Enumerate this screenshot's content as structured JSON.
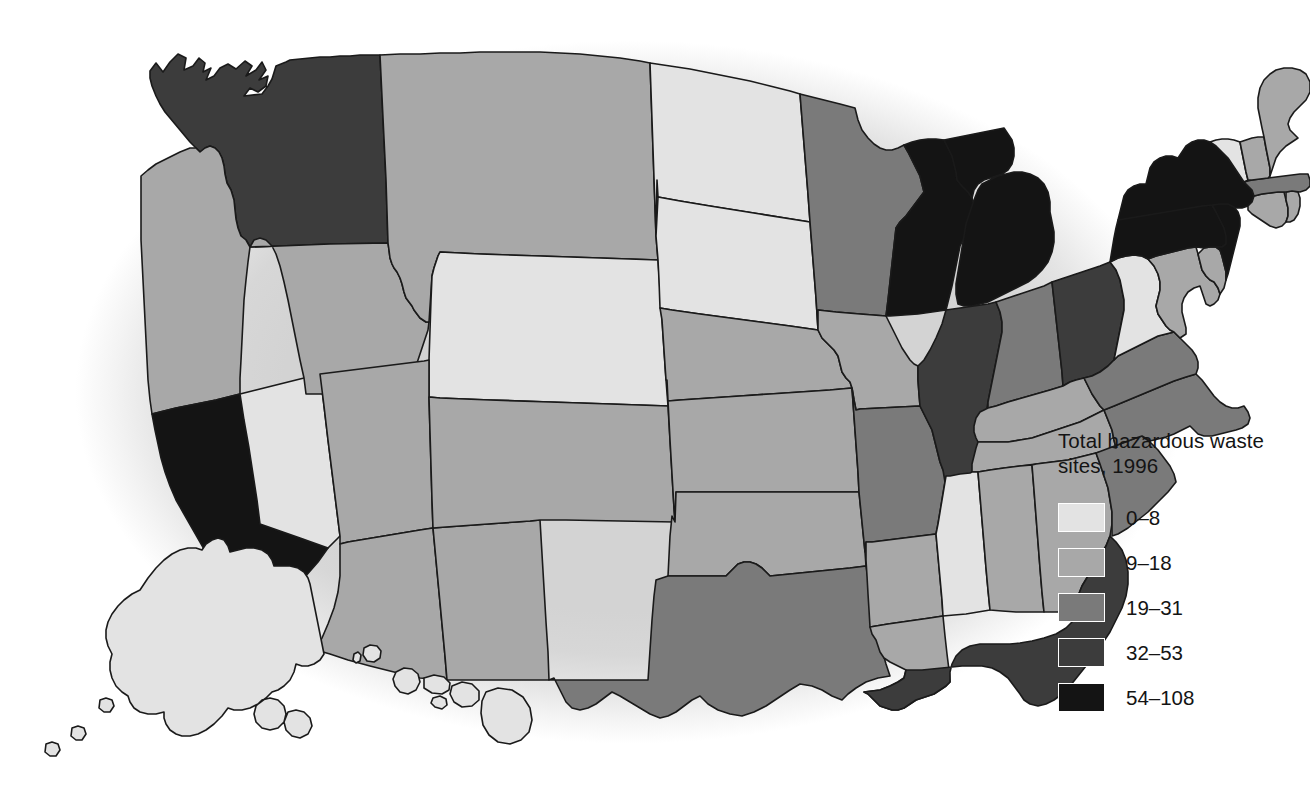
{
  "legend": {
    "title": "Total hazardous waste sites, 1996",
    "title_line1": "Total hazardous waste",
    "title_line2": "sites, 1996",
    "classes": [
      {
        "label": "0–8",
        "color": "#e3e3e3",
        "min": 0,
        "max": 8
      },
      {
        "label": "9–18",
        "color": "#a8a8a8",
        "min": 9,
        "max": 18
      },
      {
        "label": "19–31",
        "color": "#7a7a7a",
        "min": 19,
        "max": 31
      },
      {
        "label": "32–53",
        "color": "#3c3c3c",
        "min": 32,
        "max": 53
      },
      {
        "label": "54–108",
        "color": "#141414",
        "min": 54,
        "max": 108
      }
    ]
  },
  "map": {
    "background_color": "#d3d3d3",
    "border_color": "#1a1a1a",
    "page_color": "#ffffff"
  },
  "chart_data": {
    "type": "map",
    "title": "Total hazardous waste sites, 1996",
    "variable": "Total hazardous waste sites",
    "year": 1996,
    "classification": "choropleth, 5 classes",
    "bins": [
      "0–8",
      "9–18",
      "19–31",
      "32–53",
      "54–108"
    ],
    "bin_colors": [
      "#e3e3e3",
      "#a8a8a8",
      "#7a7a7a",
      "#3c3c3c",
      "#141414"
    ],
    "states": [
      {
        "code": "WA",
        "name": "Washington",
        "bin": 3
      },
      {
        "code": "OR",
        "name": "Oregon",
        "bin": 1
      },
      {
        "code": "CA",
        "name": "California",
        "bin": 4
      },
      {
        "code": "NV",
        "name": "Nevada",
        "bin": 0
      },
      {
        "code": "ID",
        "name": "Idaho",
        "bin": 1
      },
      {
        "code": "MT",
        "name": "Montana",
        "bin": 1
      },
      {
        "code": "WY",
        "name": "Wyoming",
        "bin": 0
      },
      {
        "code": "UT",
        "name": "Utah",
        "bin": 1
      },
      {
        "code": "AZ",
        "name": "Arizona",
        "bin": 1
      },
      {
        "code": "NM",
        "name": "New Mexico",
        "bin": 1
      },
      {
        "code": "CO",
        "name": "Colorado",
        "bin": 1
      },
      {
        "code": "ND",
        "name": "North Dakota",
        "bin": 0
      },
      {
        "code": "SD",
        "name": "South Dakota",
        "bin": 0
      },
      {
        "code": "NE",
        "name": "Nebraska",
        "bin": 1
      },
      {
        "code": "KS",
        "name": "Kansas",
        "bin": 1
      },
      {
        "code": "OK",
        "name": "Oklahoma",
        "bin": 1
      },
      {
        "code": "TX",
        "name": "Texas",
        "bin": 2
      },
      {
        "code": "MN",
        "name": "Minnesota",
        "bin": 2
      },
      {
        "code": "IA",
        "name": "Iowa",
        "bin": 1
      },
      {
        "code": "MO",
        "name": "Missouri",
        "bin": 2
      },
      {
        "code": "AR",
        "name": "Arkansas",
        "bin": 1
      },
      {
        "code": "LA",
        "name": "Louisiana",
        "bin": 1
      },
      {
        "code": "WI",
        "name": "Wisconsin",
        "bin": 4
      },
      {
        "code": "IL",
        "name": "Illinois",
        "bin": 3
      },
      {
        "code": "MI",
        "name": "Michigan",
        "bin": 4
      },
      {
        "code": "IN",
        "name": "Indiana",
        "bin": 2
      },
      {
        "code": "OH",
        "name": "Ohio",
        "bin": 3
      },
      {
        "code": "KY",
        "name": "Kentucky",
        "bin": 1
      },
      {
        "code": "TN",
        "name": "Tennessee",
        "bin": 1
      },
      {
        "code": "MS",
        "name": "Mississippi",
        "bin": 0
      },
      {
        "code": "AL",
        "name": "Alabama",
        "bin": 1
      },
      {
        "code": "GA",
        "name": "Georgia",
        "bin": 1
      },
      {
        "code": "FL",
        "name": "Florida",
        "bin": 3
      },
      {
        "code": "SC",
        "name": "South Carolina",
        "bin": 2
      },
      {
        "code": "NC",
        "name": "North Carolina",
        "bin": 2
      },
      {
        "code": "VA",
        "name": "Virginia",
        "bin": 2
      },
      {
        "code": "WV",
        "name": "West Virginia",
        "bin": 0
      },
      {
        "code": "MD",
        "name": "Maryland",
        "bin": 1
      },
      {
        "code": "DE",
        "name": "Delaware",
        "bin": 1
      },
      {
        "code": "PA",
        "name": "Pennsylvania",
        "bin": 4
      },
      {
        "code": "NJ",
        "name": "New Jersey",
        "bin": 4
      },
      {
        "code": "NY",
        "name": "New York",
        "bin": 4
      },
      {
        "code": "CT",
        "name": "Connecticut",
        "bin": 1
      },
      {
        "code": "RI",
        "name": "Rhode Island",
        "bin": 1
      },
      {
        "code": "MA",
        "name": "Massachusetts",
        "bin": 2
      },
      {
        "code": "VT",
        "name": "Vermont",
        "bin": 0
      },
      {
        "code": "NH",
        "name": "New Hampshire",
        "bin": 1
      },
      {
        "code": "ME",
        "name": "Maine",
        "bin": 1
      },
      {
        "code": "AK",
        "name": "Alaska",
        "bin": 0
      },
      {
        "code": "HI",
        "name": "Hawaii",
        "bin": 0
      }
    ]
  }
}
